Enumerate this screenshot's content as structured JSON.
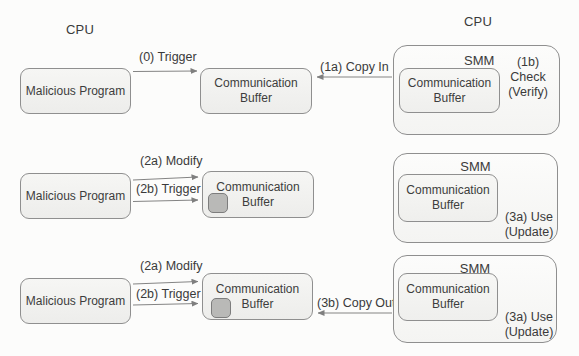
{
  "colors": {
    "background": "#fcfcfb",
    "box_fill": "#f2f2f0",
    "box_border": "#8f8f8f",
    "smm_fill": "#fbfbfa",
    "arrow": "#7f7f7f",
    "text": "#3a3a3a",
    "modified_chip_fill": "#b9b9b7",
    "modified_chip_border": "#7d7d7d"
  },
  "header": {
    "cpu_left": "CPU",
    "cpu_right": "CPU"
  },
  "row1": {
    "malicious_program": "Malicious Program",
    "trigger_label": "(0) Trigger",
    "comm_buffer": "Communication Buffer",
    "copy_in_label": "(1a) Copy In",
    "smm_title": "SMM",
    "smm_buffer": "Communication Buffer",
    "check_line1": "(1b) Check",
    "check_line2": "(Verify)"
  },
  "row2": {
    "malicious_program": "Malicious Program",
    "modify_label": "(2a) Modify",
    "trigger_label": "(2b) Trigger",
    "comm_buffer": "Communication Buffer",
    "smm_title": "SMM",
    "smm_buffer": "Communication Buffer",
    "use_line1": "(3a) Use",
    "use_line2": "(Update)"
  },
  "row3": {
    "malicious_program": "Malicious Program",
    "modify_label": "(2a) Modify",
    "trigger_label": "(2b) Trigger",
    "comm_buffer": "Communication Buffer",
    "copy_out_label": "(3b) Copy Out",
    "smm_title": "SMM",
    "smm_buffer": "Communication Buffer",
    "use_line1": "(3a) Use",
    "use_line2": "(Update)"
  }
}
